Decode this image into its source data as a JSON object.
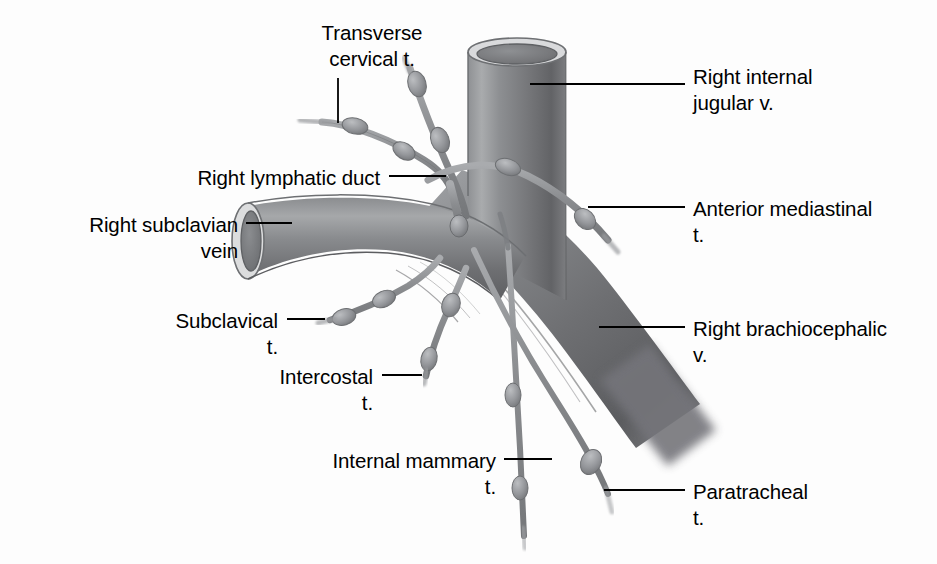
{
  "figure": {
    "background_color": "#fdfdfd",
    "ink_color": "#000000",
    "vessel_colors": {
      "vein_dark": "#6f7073",
      "vein_mid": "#85878a",
      "vein_light": "#b9bbbd",
      "vein_rim_highlight": "#e2e3e4",
      "vein_lumen": "#77787b",
      "lymph_vessel": "#8a8c8f",
      "lymph_node": "#9a9c9f",
      "outline": "#5a5c5e"
    }
  },
  "labels": [
    {
      "id": "transverse-cervical",
      "text": "Transverse\ncervical t.",
      "align": "center",
      "x": 277,
      "y": 20,
      "width": 190,
      "leader": {
        "type": "vertical",
        "x": 338,
        "y1": 78,
        "y2": 123
      }
    },
    {
      "id": "right-internal-jugular",
      "text": "Right internal\njugular v.",
      "align": "left",
      "x": 693,
      "y": 64,
      "width": 230,
      "leader": {
        "type": "horizontal",
        "y": 84,
        "x1": 530,
        "x2": 685
      }
    },
    {
      "id": "right-lymphatic-duct",
      "text": "Right lymphatic duct",
      "align": "right",
      "x": 165,
      "y": 165,
      "width": 215,
      "leader": {
        "type": "horizontal",
        "y": 176,
        "x1": 389,
        "x2": 446
      }
    },
    {
      "id": "anterior-mediastinal",
      "text": "Anterior mediastinal\nt.",
      "align": "left",
      "x": 693,
      "y": 196,
      "width": 240,
      "leader": {
        "type": "horizontal",
        "y": 207,
        "x1": 588,
        "x2": 685
      }
    },
    {
      "id": "right-subclavian-vein",
      "text": "Right subclavian\nvein",
      "align": "right",
      "x": 38,
      "y": 212,
      "width": 200,
      "leader": {
        "type": "horizontal",
        "y": 223,
        "x1": 246,
        "x2": 292
      }
    },
    {
      "id": "right-brachiocephalic",
      "text": "Right brachiocephalic\nv.",
      "align": "left",
      "x": 693,
      "y": 316,
      "width": 245,
      "leader": {
        "type": "horizontal",
        "y": 327,
        "x1": 599,
        "x2": 685
      }
    },
    {
      "id": "subclavical",
      "text": "Subclavical\nt.",
      "align": "right",
      "x": 148,
      "y": 308,
      "width": 130,
      "leader": {
        "type": "horizontal",
        "y": 319,
        "x1": 287,
        "x2": 325
      }
    },
    {
      "id": "intercostal",
      "text": "Intercostal\nt.",
      "align": "right",
      "x": 248,
      "y": 364,
      "width": 125,
      "leader": {
        "type": "horizontal",
        "y": 375,
        "x1": 382,
        "x2": 422
      }
    },
    {
      "id": "internal-mammary",
      "text": "Internal mammary\nt.",
      "align": "right",
      "x": 281,
      "y": 448,
      "width": 215,
      "leader": {
        "type": "horizontal",
        "y": 459,
        "x1": 504,
        "x2": 552
      }
    },
    {
      "id": "paratracheal",
      "text": "Paratracheal\nt.",
      "align": "left",
      "x": 693,
      "y": 479,
      "width": 175,
      "leader": {
        "type": "horizontal",
        "y": 490,
        "x1": 604,
        "x2": 685
      }
    }
  ],
  "structures": [
    {
      "id": "right-internal-jugular-vein",
      "name": "Right internal jugular v."
    },
    {
      "id": "right-subclavian-vein",
      "name": "Right subclavian vein"
    },
    {
      "id": "right-brachiocephalic-vein",
      "name": "Right brachiocephalic v."
    },
    {
      "id": "right-lymphatic-duct",
      "name": "Right lymphatic duct"
    },
    {
      "id": "transverse-cervical-trunk",
      "name": "Transverse cervical t."
    },
    {
      "id": "anterior-mediastinal-trunk",
      "name": "Anterior mediastinal t."
    },
    {
      "id": "subclavical-trunk",
      "name": "Subclavical t."
    },
    {
      "id": "intercostal-trunk",
      "name": "Intercostal t."
    },
    {
      "id": "internal-mammary-trunk",
      "name": "Internal mammary t."
    },
    {
      "id": "paratracheal-trunk",
      "name": "Paratracheal t."
    }
  ]
}
